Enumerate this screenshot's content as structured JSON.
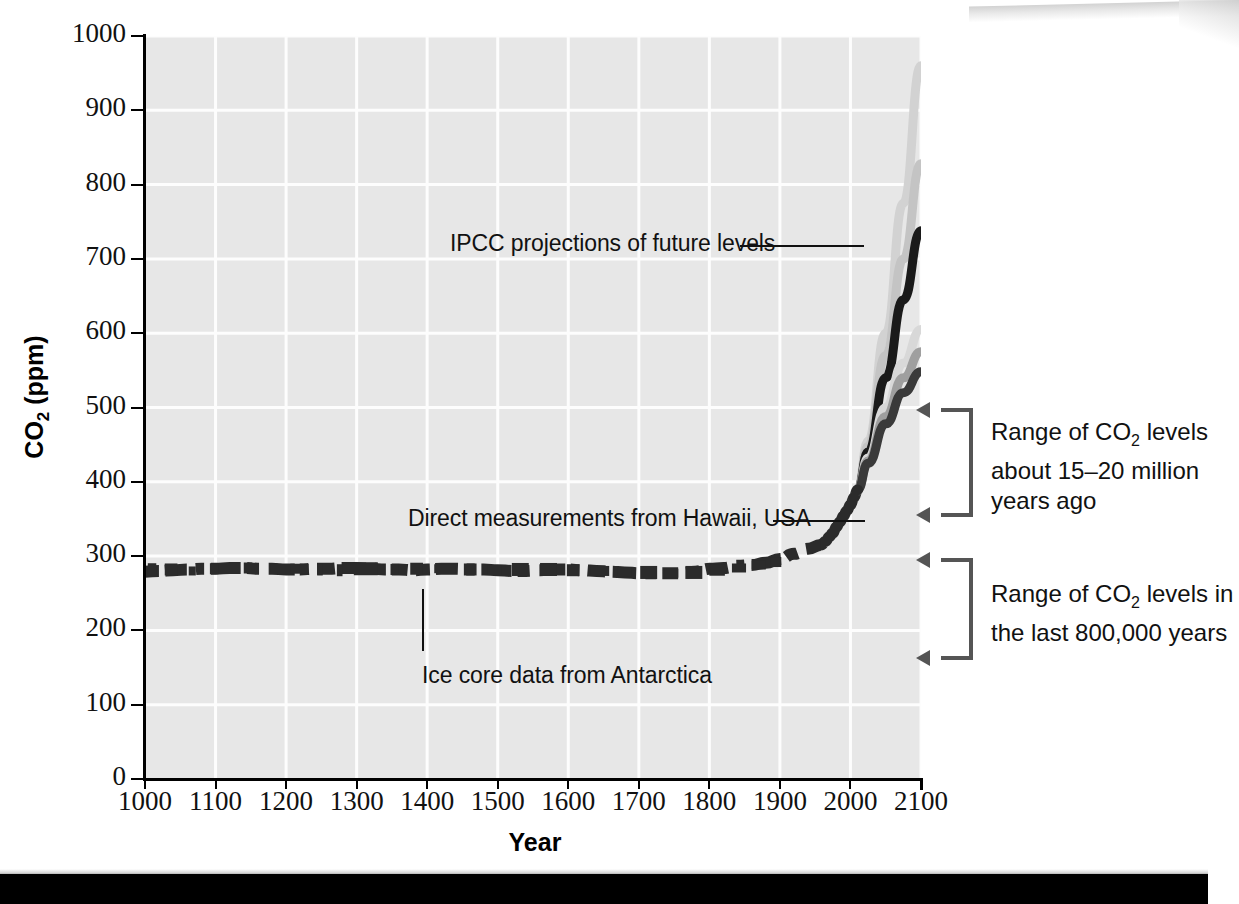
{
  "figure": {
    "background_color": "#ffffff",
    "plot_background_color": "#e7e7e6",
    "gridline_color": "#fdfdfd"
  },
  "axis_titles": {
    "x": "Year",
    "y_prefix": "CO",
    "y_sub": "2",
    "y_suffix": " (ppm)"
  },
  "annotations": {
    "ipcc": "IPCC projections of future levels",
    "hawaii": "Direct measurements from Hawaii, USA",
    "icecore": "Ice core data from Antarctica"
  },
  "brackets": [
    {
      "id": "bracket-miocene",
      "line1": "Range of CO",
      "line1_sub": "2",
      "line1_rest": " levels",
      "line2": "about 15–20 million",
      "line3": "years ago",
      "top_ppm": 500,
      "bottom_ppm": 352,
      "color": "#555555"
    },
    {
      "id": "bracket-800k",
      "line1": "Range of CO",
      "line1_sub": "2",
      "line1_rest": " levels in",
      "line2": "the last 800,000 years",
      "line3": "",
      "top_ppm": 298,
      "bottom_ppm": 160,
      "color": "#555555"
    }
  ],
  "chart_data": {
    "type": "line",
    "title": "",
    "xlabel": "Year",
    "ylabel": "CO2 (ppm)",
    "xlim": [
      1000,
      2100
    ],
    "ylim": [
      0,
      1000
    ],
    "xticks": [
      1000,
      1100,
      1200,
      1300,
      1400,
      1500,
      1600,
      1700,
      1800,
      1900,
      2000,
      2100
    ],
    "yticks": [
      0,
      100,
      200,
      300,
      400,
      500,
      600,
      700,
      800,
      900,
      1000
    ],
    "grid": true,
    "legend_position": "inline-annotations",
    "series": [
      {
        "name": "Ice core data from Antarctica",
        "color": "#2b2b2b",
        "style": "dashed-band",
        "x": [
          1000,
          1020,
          1040,
          1060,
          1080,
          1100,
          1120,
          1140,
          1160,
          1180,
          1200,
          1220,
          1240,
          1260,
          1280,
          1300,
          1320,
          1340,
          1360,
          1380,
          1400,
          1420,
          1440,
          1460,
          1480,
          1500,
          1520,
          1540,
          1560,
          1580,
          1600,
          1620,
          1640,
          1660,
          1680,
          1700,
          1720,
          1740,
          1760,
          1780,
          1800,
          1820,
          1840,
          1860,
          1880,
          1900,
          1920,
          1940,
          1958
        ],
        "y": [
          279,
          280,
          281,
          282,
          283,
          283,
          284,
          284,
          283,
          283,
          282,
          282,
          283,
          283,
          284,
          284,
          283,
          282,
          282,
          281,
          282,
          283,
          283,
          282,
          282,
          281,
          280,
          280,
          281,
          282,
          282,
          281,
          280,
          279,
          278,
          277,
          277,
          277,
          277,
          279,
          283,
          284,
          287,
          288,
          291,
          296,
          303,
          310,
          315
        ]
      },
      {
        "name": "Direct measurements from Hawaii, USA",
        "color": "#2b2b2b",
        "style": "solid-thick",
        "x": [
          1958,
          1965,
          1970,
          1975,
          1980,
          1985,
          1990,
          1995,
          2000,
          2005,
          2010
        ],
        "y": [
          315,
          320,
          326,
          331,
          339,
          346,
          354,
          361,
          369,
          379,
          389
        ]
      },
      {
        "name": "IPCC projection - highest scenario",
        "color": "#d2d2d2",
        "style": "solid-thick",
        "x": [
          2010,
          2025,
          2050,
          2075,
          2100
        ],
        "y": [
          389,
          455,
          600,
          775,
          960
        ]
      },
      {
        "name": "IPCC projection - high scenario",
        "color": "#c4c4c4",
        "style": "solid-thick",
        "x": [
          2010,
          2025,
          2050,
          2075,
          2100
        ],
        "y": [
          389,
          448,
          570,
          700,
          828
        ]
      },
      {
        "name": "IPCC projection - mid-high scenario",
        "color": "#1a1a1a",
        "style": "solid-thick",
        "x": [
          2010,
          2025,
          2050,
          2075,
          2100
        ],
        "y": [
          389,
          440,
          540,
          645,
          738
        ]
      },
      {
        "name": "IPCC projection - mid scenario",
        "color": "#d8d8d8",
        "style": "solid-thick",
        "x": [
          2010,
          2025,
          2050,
          2075,
          2100
        ],
        "y": [
          389,
          432,
          500,
          560,
          605
        ]
      },
      {
        "name": "IPCC projection - low-mid scenario",
        "color": "#9f9f9f",
        "style": "solid-thick",
        "x": [
          2010,
          2025,
          2050,
          2075,
          2100
        ],
        "y": [
          389,
          428,
          488,
          540,
          575
        ]
      },
      {
        "name": "IPCC projection - lowest scenario",
        "color": "#3a3a3a",
        "style": "solid-thick",
        "x": [
          2010,
          2025,
          2050,
          2075,
          2100
        ],
        "y": [
          389,
          425,
          478,
          520,
          548
        ]
      }
    ]
  }
}
